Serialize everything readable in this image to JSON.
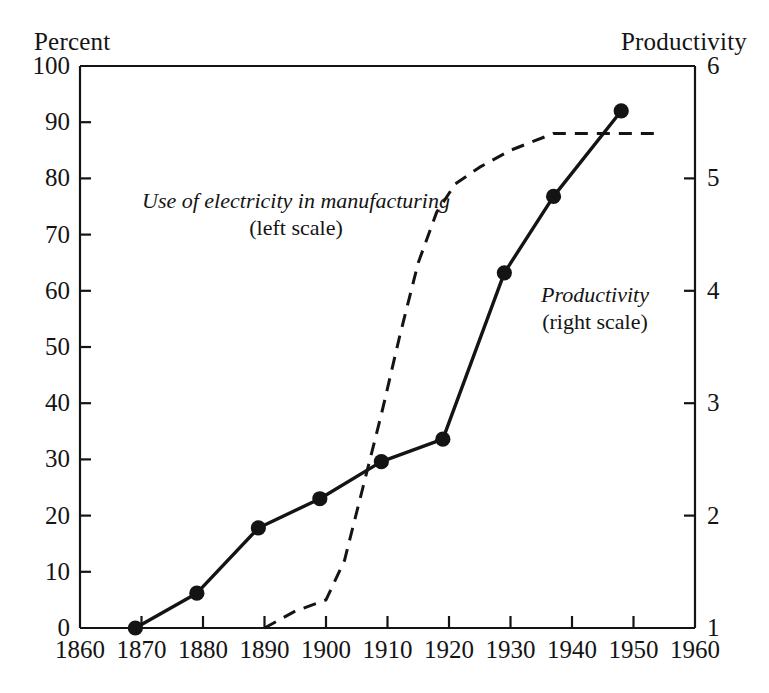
{
  "figure": {
    "left_axis_header": "Percent",
    "right_axis_header": "Productivity",
    "background": "#ffffff",
    "ink": "#141414"
  },
  "annotations": {
    "electricity": {
      "line1": "Use of electricity in manufacturing",
      "line2": "(left scale)"
    },
    "productivity": {
      "line1": "Productivity",
      "line2": "(right scale)"
    }
  },
  "chart_data": {
    "type": "line",
    "title": "",
    "xlabel": "",
    "ylabel": "Percent",
    "y2label": "Productivity",
    "xlim": [
      1860,
      1960
    ],
    "ylim": [
      0,
      100
    ],
    "y2lim": [
      1,
      6
    ],
    "grid": false,
    "legend": "inline annotations",
    "xticks": [
      1860,
      1870,
      1880,
      1890,
      1900,
      1910,
      1920,
      1930,
      1940,
      1950,
      1960
    ],
    "xticklabels": [
      "1860",
      "1870",
      "1880",
      "1890",
      "1900",
      "1910",
      "1920",
      "1930",
      "1940",
      "1950",
      "1960"
    ],
    "yticks": [
      0,
      10,
      20,
      30,
      40,
      50,
      60,
      70,
      80,
      90,
      100
    ],
    "yticklabels": [
      "0",
      "10",
      "20",
      "30",
      "40",
      "50",
      "60",
      "70",
      "80",
      "90",
      "100"
    ],
    "y2ticks": [
      1,
      2,
      3,
      4,
      5,
      6
    ],
    "y2ticklabels": [
      "1",
      "2",
      "3",
      "4",
      "5",
      "6"
    ],
    "series": [
      {
        "name": "Use of electricity in manufacturing",
        "axis": "left",
        "style": "dashed",
        "marker": "none",
        "color": "#141414",
        "points": [
          {
            "x": 1890,
            "y": 0
          },
          {
            "x": 1895,
            "y": 3
          },
          {
            "x": 1900,
            "y": 5
          },
          {
            "x": 1903,
            "y": 12
          },
          {
            "x": 1906,
            "y": 25
          },
          {
            "x": 1909,
            "y": 38
          },
          {
            "x": 1912,
            "y": 52
          },
          {
            "x": 1915,
            "y": 65
          },
          {
            "x": 1918,
            "y": 74
          },
          {
            "x": 1921,
            "y": 79
          },
          {
            "x": 1925,
            "y": 82
          },
          {
            "x": 1930,
            "y": 85
          },
          {
            "x": 1937,
            "y": 88
          },
          {
            "x": 1941,
            "y": 88
          },
          {
            "x": 1954,
            "y": 88
          }
        ]
      },
      {
        "name": "Productivity",
        "axis": "right",
        "style": "solid",
        "marker": "filled-circle",
        "color": "#141414",
        "points": [
          {
            "x": 1869,
            "y": 1.0,
            "left_equiv": 0.0
          },
          {
            "x": 1879,
            "y": 1.31,
            "left_equiv": 6.2
          },
          {
            "x": 1889,
            "y": 1.89,
            "left_equiv": 17.8
          },
          {
            "x": 1899,
            "y": 2.15,
            "left_equiv": 23.0
          },
          {
            "x": 1909,
            "y": 2.48,
            "left_equiv": 29.6
          },
          {
            "x": 1919,
            "y": 2.68,
            "left_equiv": 33.6
          },
          {
            "x": 1929,
            "y": 4.16,
            "left_equiv": 63.1
          },
          {
            "x": 1937,
            "y": 4.84,
            "left_equiv": 76.7
          },
          {
            "x": 1948,
            "y": 5.6,
            "left_equiv": 92.0
          }
        ]
      }
    ]
  },
  "geometry": {
    "plot_left": 80,
    "plot_right": 695,
    "plot_top": 66,
    "plot_bottom": 628
  }
}
